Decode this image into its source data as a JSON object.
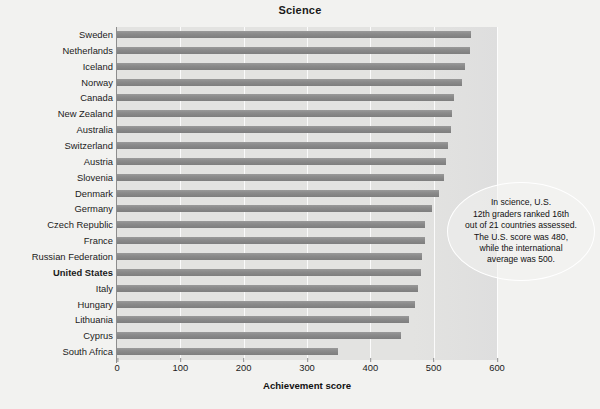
{
  "chart_data": {
    "type": "bar",
    "orientation": "horizontal",
    "title": "Science",
    "xlabel": "Achievement score",
    "ylabel": "",
    "xlim": [
      0,
      600
    ],
    "xticks": [
      0,
      100,
      200,
      300,
      400,
      500,
      600
    ],
    "grid": "vertical",
    "legend": "none",
    "highlight_category": "United States",
    "categories": [
      "Sweden",
      "Netherlands",
      "Iceland",
      "Norway",
      "Canada",
      "New Zealand",
      "Australia",
      "Switzerland",
      "Austria",
      "Slovenia",
      "Denmark",
      "Germany",
      "Czech Republic",
      "France",
      "Russian Federation",
      "United States",
      "Italy",
      "Hungary",
      "Lithuania",
      "Cyprus",
      "South Africa"
    ],
    "values": [
      559,
      558,
      549,
      544,
      532,
      529,
      527,
      523,
      520,
      517,
      509,
      497,
      487,
      487,
      481,
      480,
      475,
      471,
      461,
      448,
      349
    ],
    "annotations": [
      {
        "name": "us-ranking-callout",
        "shape": "ellipse",
        "lines": [
          "In science, U.S.",
          "12th graders ranked 16th",
          "out of 21 countries assessed.",
          "The U.S. score was 480,",
          "while the international",
          "average was 500."
        ],
        "text": "In science, U.S. 12th graders ranked 16th out of 21 countries assessed. The U.S. score was 480, while the international average was 500."
      }
    ],
    "colors": {
      "bar": "#8b8b8b",
      "plot_background": "#e3e3e1",
      "page_background": "#f2f2f0",
      "gridline": "#ffffff",
      "axis": "#8d8d8d",
      "text": "#111111"
    }
  }
}
